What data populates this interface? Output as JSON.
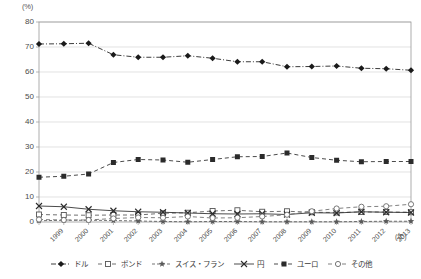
{
  "chart_data": {
    "type": "line",
    "title": "",
    "subtitle": "",
    "xlabel": "(年)",
    "ylabel": "(%)",
    "ylim": [
      0,
      80
    ],
    "yticks": [
      0,
      10,
      20,
      30,
      40,
      50,
      60,
      70,
      80
    ],
    "grid": true,
    "legend_position": "bottom",
    "categories": [
      "1999",
      "2000",
      "2001",
      "2002",
      "2003",
      "2004",
      "2005",
      "2006",
      "2007",
      "2008",
      "2009",
      "2010",
      "2011",
      "2012",
      "2013",
      "2014年8月"
    ],
    "series": [
      {
        "name": "ドル",
        "marker": "filled-diamond",
        "color": "#1a1a1a",
        "values": [
          71.2,
          71.3,
          71.5,
          66.9,
          65.9,
          65.9,
          66.5,
          65.5,
          64.1,
          64.1,
          62.1,
          62.2,
          62.4,
          61.5,
          61.3,
          60.7
        ]
      },
      {
        "name": "ポンド",
        "marker": "open-square",
        "color": "#555555",
        "values": [
          3.0,
          2.8,
          2.7,
          2.8,
          2.8,
          3.5,
          3.7,
          4.4,
          4.7,
          4.1,
          4.3,
          3.9,
          3.8,
          4.0,
          4.0,
          3.9
        ]
      },
      {
        "name": "スイス・フラン",
        "marker": "filled-star",
        "color": "#5a5a5a",
        "values": [
          0.5,
          0.7,
          0.7,
          0.6,
          0.4,
          0.2,
          0.1,
          0.2,
          0.2,
          0.1,
          0.1,
          0.1,
          0.1,
          0.2,
          0.3,
          0.3
        ]
      },
      {
        "name": "円",
        "marker": "cross-x",
        "color": "#2b2b2b",
        "values": [
          6.4,
          6.1,
          5.1,
          4.5,
          4.1,
          3.9,
          3.6,
          3.3,
          3.2,
          3.3,
          3.0,
          3.7,
          3.6,
          4.1,
          3.9,
          3.8
        ]
      },
      {
        "name": "ユーロ",
        "marker": "filled-square",
        "color": "#2b2b2b",
        "values": [
          17.9,
          18.3,
          19.2,
          23.8,
          25.0,
          24.8,
          23.9,
          25.0,
          26.1,
          26.2,
          27.6,
          25.8,
          24.7,
          24.1,
          24.2,
          24.2
        ]
      },
      {
        "name": "その他",
        "marker": "open-circle",
        "color": "#6a6a6a",
        "values": [
          1.0,
          0.8,
          0.8,
          1.4,
          1.8,
          1.7,
          2.2,
          1.6,
          1.7,
          2.2,
          2.9,
          4.3,
          5.4,
          6.1,
          6.3,
          7.1
        ]
      }
    ],
    "peak_annotations": [
      {
        "series": "スイス・フラン",
        "x": "2002",
        "value": 0.6
      }
    ]
  },
  "legend": {
    "items": [
      {
        "label": "ドル"
      },
      {
        "label": "ポンド"
      },
      {
        "label": "スイス・フラン"
      },
      {
        "label": "円"
      },
      {
        "label": "ユーロ"
      },
      {
        "label": "その他"
      }
    ]
  }
}
